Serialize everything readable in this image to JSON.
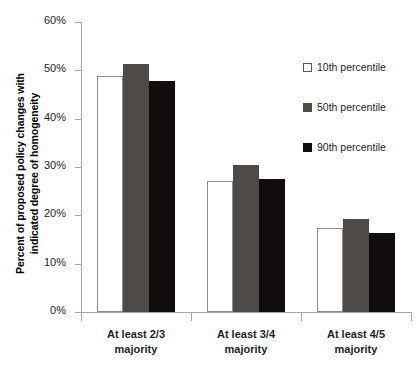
{
  "chart_data": {
    "type": "bar",
    "title": "",
    "xlabel": "",
    "ylabel": "Percent of proposed policy changes with indicated degree of homogeneity",
    "ylabel_lines": [
      "Percent of proposed policy changes with",
      "indicated degree of homogeneity"
    ],
    "categories": [
      "At least 2/3 majority",
      "At least 3/4 majority",
      "At least 4/5 majority"
    ],
    "category_lines": [
      [
        "At least 2/3",
        "majority"
      ],
      [
        "At least 3/4",
        "majority"
      ],
      [
        "At least 4/5",
        "majority"
      ]
    ],
    "series": [
      {
        "name": "10th percentile",
        "color": "#ffffff",
        "values": [
          48.8,
          27.2,
          17.3
        ]
      },
      {
        "name": "50th percentile",
        "color": "#4d4a48",
        "values": [
          51.3,
          30.5,
          19.2
        ]
      },
      {
        "name": "90th percentile",
        "color": "#100d0c",
        "values": [
          47.7,
          27.5,
          16.4
        ]
      }
    ],
    "ylim": [
      0,
      60
    ],
    "ytick_values": [
      0,
      10,
      20,
      30,
      40,
      50,
      60
    ],
    "ytick_labels": [
      "0%",
      "10%",
      "20%",
      "30%",
      "40%",
      "50%",
      "60%"
    ],
    "grid": false,
    "legend_position": "right-top",
    "axis_color": "#a6a6a6",
    "text_color": "#231f20"
  },
  "legend": {
    "items": [
      {
        "label": "10th percentile",
        "swatch": "p10"
      },
      {
        "label": "50th percentile",
        "swatch": "p50"
      },
      {
        "label": "90th percentile",
        "swatch": "p90"
      }
    ]
  },
  "yticks": {
    "t0": "0%",
    "t10": "10%",
    "t20": "20%",
    "t30": "30%",
    "t40": "40%",
    "t50": "50%",
    "t60": "60%"
  },
  "ylabel": {
    "line1": "Percent of proposed policy changes with",
    "line2": "indicated degree of homogeneity"
  },
  "categories": {
    "c0_l1": "At least 2/3",
    "c0_l2": "majority",
    "c1_l1": "At least 3/4",
    "c1_l2": "majority",
    "c2_l1": "At least 4/5",
    "c2_l2": "majority"
  }
}
